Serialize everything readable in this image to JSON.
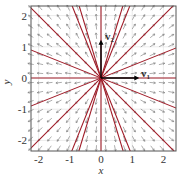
{
  "chart_data": {
    "type": "vector-field",
    "title": "",
    "xlabel": "x",
    "ylabel": "y",
    "xlim": [
      -2.3,
      2.4
    ],
    "ylim": [
      -2.4,
      2.3
    ],
    "xticks": [
      "-2",
      "-1",
      "0",
      "1",
      "2"
    ],
    "yticks": [
      "2",
      "1",
      "0",
      "-1",
      "-2"
    ],
    "grid": true,
    "field": "radial outward (star node, dx/dt = x, dy/dt = y)",
    "eigenvectors": [
      {
        "label": "v1",
        "direction": [
          1,
          0
        ]
      },
      {
        "label": "v2",
        "direction": [
          0,
          1
        ]
      }
    ],
    "trajectory_lines_through_origin_slopes": [
      "0",
      "0.4",
      "1",
      "2.5",
      "inf",
      "-2.5",
      "-1",
      "-0.4",
      "3.3",
      "-3.3"
    ],
    "trajectory_color": "#a01c28"
  },
  "labels": {
    "x": "x",
    "y": "y",
    "v1": "v",
    "v1sub": "1",
    "v2": "v",
    "v2sub": "2"
  }
}
